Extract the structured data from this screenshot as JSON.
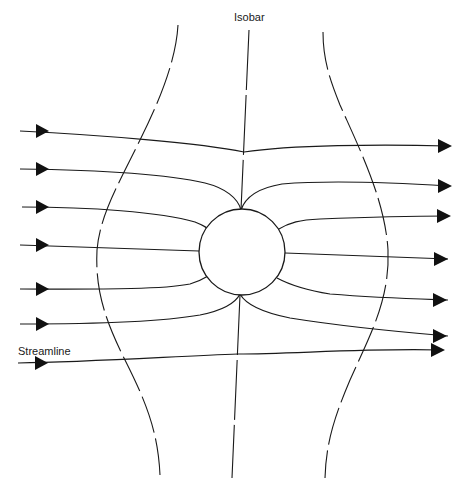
{
  "figure": {
    "type": "flow-around-cylinder",
    "labels": {
      "isobar": "Isobar",
      "streamline": "Streamline"
    },
    "streamline_count": 7,
    "isobar_count": 3,
    "obstacle": "circle",
    "flow_direction": "left-to-right",
    "colors": {
      "ink": "#1a1a1a",
      "background": "#ffffff"
    }
  }
}
